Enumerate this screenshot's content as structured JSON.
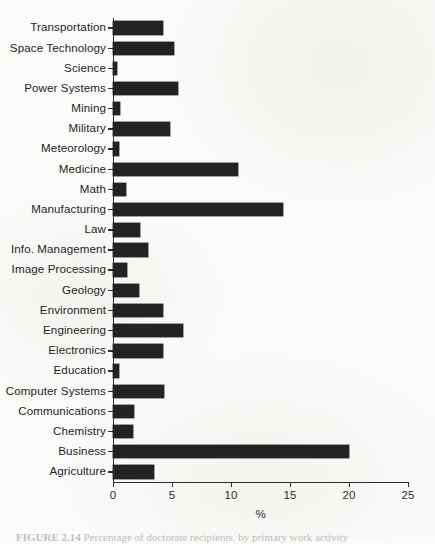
{
  "figure": {
    "axis_title": "%",
    "caption_prefix": "FIGURE 2.14",
    "caption_text": "Percentage of doctorate recipients, by primary work activity"
  },
  "axis": {
    "x_ticks": [
      "0",
      "5",
      "10",
      "15",
      "20",
      "25"
    ],
    "x_min": 0,
    "x_max": 25
  },
  "chart_data": {
    "type": "bar",
    "orientation": "horizontal",
    "title": "",
    "xlabel": "%",
    "ylabel": "",
    "xlim": [
      0,
      25
    ],
    "grid": false,
    "legend": "none",
    "bar_color": "#232323",
    "categories": [
      "Transportation",
      "Space Technology",
      "Science",
      "Power Systems",
      "Mining",
      "Military",
      "Meteorology",
      "Medicine",
      "Math",
      "Manufacturing",
      "Law",
      "Info. Management",
      "Image Processing",
      "Geology",
      "Environment",
      "Engineering",
      "Electronics",
      "Education",
      "Computer Systems",
      "Communications",
      "Chemistry",
      "Business",
      "Agriculture"
    ],
    "values": [
      4.2,
      5.2,
      0.3,
      5.5,
      0.6,
      4.8,
      0.5,
      10.6,
      1.1,
      14.4,
      2.3,
      3.0,
      1.2,
      2.2,
      4.2,
      5.9,
      4.2,
      0.5,
      4.3,
      1.8,
      1.7,
      20.0,
      3.5
    ]
  }
}
